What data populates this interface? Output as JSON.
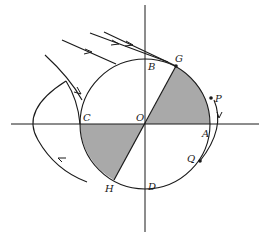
{
  "diagram": {
    "colors": {
      "stroke": "#1a1a1a",
      "shade": "#a9a9a9",
      "background": "#ffffff"
    },
    "labels": {
      "O": "O",
      "A": "A",
      "B": "B",
      "C": "C",
      "D": "D",
      "G": "G",
      "H": "H",
      "P": "P",
      "Q": "Q"
    },
    "points": {
      "P": "point-p-dot",
      "Q": "point-q-dot",
      "G": "point-g-dot"
    },
    "shaded_regions": [
      "sector AOG",
      "sector COH"
    ]
  }
}
